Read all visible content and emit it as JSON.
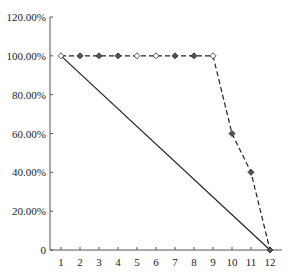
{
  "chart_data": {
    "type": "line",
    "title": "",
    "xlabel": "",
    "ylabel": "",
    "x": [
      1,
      2,
      3,
      4,
      5,
      6,
      7,
      8,
      9,
      10,
      11,
      12
    ],
    "series": [
      {
        "name": "dashed",
        "style": "dashed",
        "marker": "diamond",
        "values": [
          1.0,
          1.0,
          1.0,
          1.0,
          1.0,
          1.0,
          1.0,
          1.0,
          1.0,
          0.6,
          0.4,
          0.0
        ]
      },
      {
        "name": "solid",
        "style": "solid",
        "marker": "none",
        "points": [
          [
            1,
            1.0
          ],
          [
            12,
            0.0
          ]
        ]
      }
    ],
    "yticks": [
      {
        "value": 0,
        "label": "0"
      },
      {
        "value": 0.2,
        "label": "20.00%"
      },
      {
        "value": 0.4,
        "label": "40.00%"
      },
      {
        "value": 0.6,
        "label": "60.00%"
      },
      {
        "value": 0.8,
        "label": "80.00%"
      },
      {
        "value": 1.0,
        "label": "100.00%"
      },
      {
        "value": 1.2,
        "label": "120.00%"
      }
    ],
    "xticks": [
      "1",
      "2",
      "3",
      "4",
      "5",
      "6",
      "7",
      "8",
      "9",
      "10",
      "11",
      "12"
    ],
    "ylim": [
      0,
      1.2
    ],
    "xlim": [
      0.5,
      12.6
    ],
    "grid": false,
    "legend": "none"
  },
  "colors": {
    "line": "#222222",
    "axis": "#555555"
  }
}
